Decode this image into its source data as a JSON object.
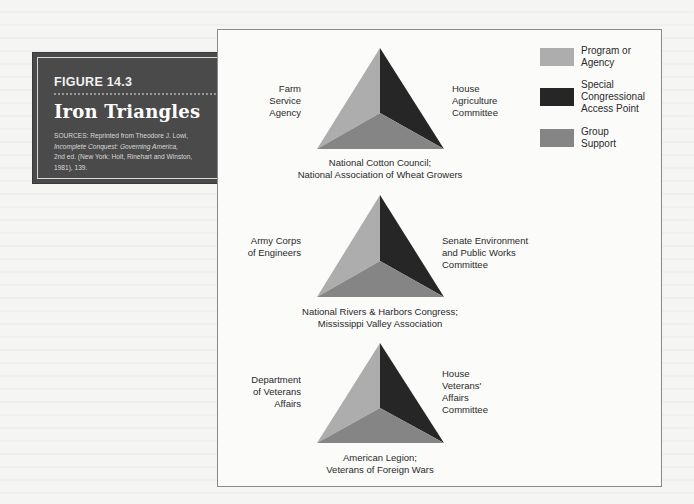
{
  "figure": {
    "number": "FIGURE 14.3",
    "title": "Iron Triangles",
    "source_lines": [
      {
        "text": "SOURCES: Reprinted from Theodore J. Lowi,",
        "italic": false
      },
      {
        "text": "Incomplete Conquest: Governing America,",
        "italic": true
      },
      {
        "text": "2nd ed. (New York: Holt, Rinehart and Winston,",
        "italic": false
      },
      {
        "text": "1981), 139.",
        "italic": false
      }
    ]
  },
  "colors": {
    "program_or_agency": "#adadad",
    "special_congressional_access_point": "#262626",
    "group_support": "#858585",
    "caption_bg": "#4a4a4a"
  },
  "legend": [
    {
      "label_lines": [
        "Program or",
        "Agency"
      ],
      "color_key": "program_or_agency"
    },
    {
      "label_lines": [
        "Special",
        "Congressional",
        "Access Point"
      ],
      "color_key": "special_congressional_access_point"
    },
    {
      "label_lines": [
        "Group",
        "Support"
      ],
      "color_key": "group_support"
    }
  ],
  "triangles": [
    {
      "agency_lines": [
        "Farm",
        "Service",
        "Agency"
      ],
      "committee_lines": [
        "House",
        "Agriculture",
        "Committee"
      ],
      "group_lines": [
        "National Cotton Council;",
        "National Association of Wheat Growers"
      ]
    },
    {
      "agency_lines": [
        "Army Corps",
        "of Engineers"
      ],
      "committee_lines": [
        "Senate Environment",
        "and Public Works",
        "Committee"
      ],
      "group_lines": [
        "National Rivers & Harbors Congress;",
        "Mississippi Valley Association"
      ]
    },
    {
      "agency_lines": [
        "Department",
        "of Veterans",
        "Affairs"
      ],
      "committee_lines": [
        "House",
        "Veterans'",
        "Affairs",
        "Committee"
      ],
      "group_lines": [
        "American Legion;",
        "Veterans of Foreign Wars"
      ]
    }
  ]
}
